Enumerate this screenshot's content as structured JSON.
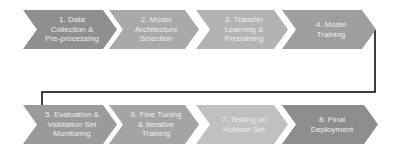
{
  "diagram": {
    "type": "process-flow",
    "rows": [
      {
        "steps": [
          {
            "label": "1. Data\nCollection &\nPre-processing",
            "color": "#8f8f8f"
          },
          {
            "label": "2. Model\nArchitecture\nSelection",
            "color": "#a9a9a9"
          },
          {
            "label": "3. Transfer\nLearning &\nPretraining",
            "color": "#b3b3b3"
          },
          {
            "label": "4. Model\nTraining",
            "color": "#9e9e9e"
          }
        ]
      },
      {
        "steps": [
          {
            "label": "5. Evaluation &\nValidation Set\nMonitoring",
            "color": "#9a9a9a"
          },
          {
            "label": "6. Fine Tuning\n& Iterative\nTraining",
            "color": "#a4a4a4"
          },
          {
            "label": "7. Testing on\nHoldout Set",
            "color": "#c0c0c0"
          },
          {
            "label": "8. Final\nDeployment",
            "color": "#8d8d8d"
          }
        ]
      }
    ],
    "connector_color": "#000000"
  }
}
